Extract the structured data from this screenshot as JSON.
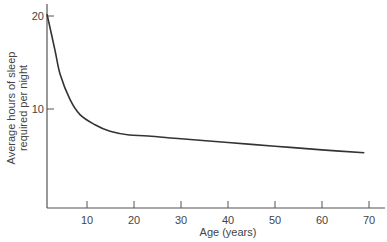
{
  "chart_data": {
    "type": "line",
    "title": "",
    "xlabel": "Age (years)",
    "ylabel": "Average hours of sleep required per night",
    "ylabel_lines": [
      "Average hours of sleep",
      "required per night"
    ],
    "xlim": [
      0,
      73
    ],
    "ylim": [
      0,
      21
    ],
    "xticks": [
      10,
      20,
      30,
      40,
      50,
      60,
      70
    ],
    "yticks": [
      10,
      20
    ],
    "grid": false,
    "legend": null,
    "series": [
      {
        "name": "Sleep required",
        "color": "#333333",
        "x": [
          1.5,
          3.2,
          4.3,
          6.4,
          8.5,
          11.7,
          14.9,
          19,
          23,
          30,
          40,
          50,
          60,
          69
        ],
        "y": [
          20.2,
          16.3,
          13.7,
          11.0,
          9.4,
          8.3,
          7.6,
          7.2,
          7.1,
          6.8,
          6.4,
          6.0,
          5.6,
          5.3
        ]
      }
    ]
  },
  "axes": {
    "x_tick_labels": [
      "10",
      "20",
      "30",
      "40",
      "50",
      "60",
      "70"
    ],
    "y_tick_labels": [
      "10",
      "20"
    ]
  }
}
